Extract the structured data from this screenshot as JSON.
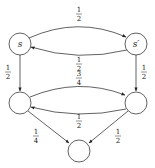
{
  "diagram": {
    "type": "markov-chain",
    "colors": {
      "stroke": "#3a3a3a",
      "text": "#222222",
      "background": "#ffffff"
    },
    "nodes": [
      {
        "id": "s",
        "label": "s",
        "cx": 20,
        "cy": 44,
        "r": 11
      },
      {
        "id": "s_prime",
        "label": "s′",
        "cx": 136,
        "cy": 44,
        "r": 11
      },
      {
        "id": "bl",
        "label": "",
        "cx": 20,
        "cy": 103,
        "r": 11
      },
      {
        "id": "br",
        "label": "",
        "cx": 136,
        "cy": 103,
        "r": 11
      },
      {
        "id": "bottom",
        "label": "",
        "cx": 79,
        "cy": 150,
        "r": 11
      }
    ],
    "edges": [
      {
        "from": "s",
        "to": "s_prime",
        "num": "1",
        "den": "2"
      },
      {
        "from": "s_prime",
        "to": "s",
        "num": "1",
        "den": "2"
      },
      {
        "from": "s",
        "to": "bl",
        "num": "1",
        "den": "2"
      },
      {
        "from": "s_prime",
        "to": "br",
        "num": "1",
        "den": "2"
      },
      {
        "from": "bl",
        "to": "br",
        "num": "3",
        "den": "4"
      },
      {
        "from": "br",
        "to": "bl",
        "num": "1",
        "den": "2"
      },
      {
        "from": "bl",
        "to": "bottom",
        "num": "1",
        "den": "4"
      },
      {
        "from": "br",
        "to": "bottom",
        "num": "1",
        "den": "2"
      }
    ]
  }
}
